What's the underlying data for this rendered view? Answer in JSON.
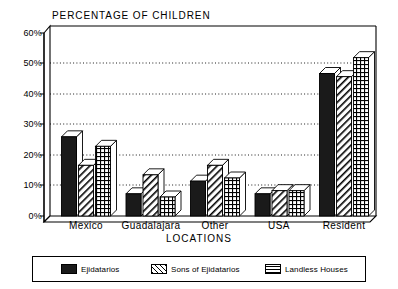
{
  "chart_data": {
    "type": "bar",
    "title": "PERCENTAGE OF CHILDREN",
    "xlabel": "LOCATIONS",
    "ylabel": "",
    "categories": [
      "Mexico",
      "Guadalajara",
      "Other",
      "USA",
      "Resident"
    ],
    "series": [
      {
        "name": "Ejidatarios",
        "values": [
          25,
          7,
          11,
          7,
          45
        ],
        "pattern": "solid"
      },
      {
        "name": "Sons of Ejidatarios",
        "values": [
          16,
          13,
          16,
          8,
          44
        ],
        "pattern": "diagonal-hatch"
      },
      {
        "name": "Landless Houses",
        "values": [
          22,
          6,
          12,
          8,
          50
        ],
        "pattern": "crosshatch-grid"
      }
    ],
    "ylim": [
      0,
      60
    ],
    "yticks": [
      "0%",
      "10%",
      "20%",
      "30%",
      "40%",
      "50%",
      "60%"
    ],
    "ytick_values": [
      0,
      10,
      20,
      30,
      40,
      50,
      60
    ],
    "grid": true,
    "grid_style": "dotted-horizontal",
    "legend_position": "bottom",
    "style": "3d-bars-black-and-white",
    "colors": {
      "ink": "#000000",
      "background": "#ffffff",
      "series1_fill": "#1a1a1a",
      "series2_fill": "#ffffff",
      "series3_fill": "#ffffff"
    }
  }
}
